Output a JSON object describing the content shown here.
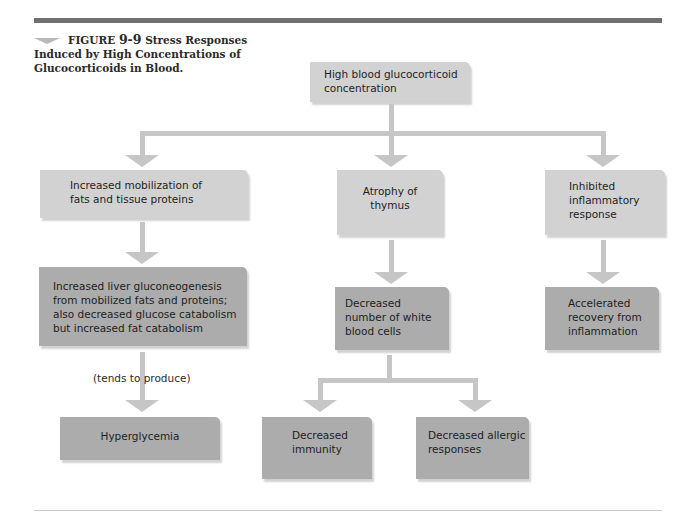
{
  "caption": {
    "figure_label": "FIGURE",
    "figure_number": "9-9",
    "title_line1": "Stress Responses",
    "title_rest": "Induced by High Concentrations of Glucocorticoids in Blood."
  },
  "nodes": {
    "root": "High blood glucocorticoid concentration",
    "mobilization": "Increased mobilization of fats and tissue proteins",
    "gluconeogenesis": "Increased liver gluconeogenesis from mobilized fats and proteins; also decreased glucose catabolism but increased fat catabolism",
    "hyperglycemia": "Hyperglycemia",
    "thymus": "Atrophy of thymus",
    "wbc": "Decreased number of white blood cells",
    "immunity": "Decreased immunity",
    "allergic": "Decreased allergic responses",
    "inflammatory": "Inhibited inflammatory response",
    "recovery": "Accelerated recovery from inflammation"
  },
  "edge_labels": {
    "tends_to_produce": "(tends to produce)"
  },
  "colors": {
    "light_box": "#d2d2d2",
    "dark_box": "#acacac",
    "connector": "#c6c6c6",
    "top_bar": "#707070"
  }
}
